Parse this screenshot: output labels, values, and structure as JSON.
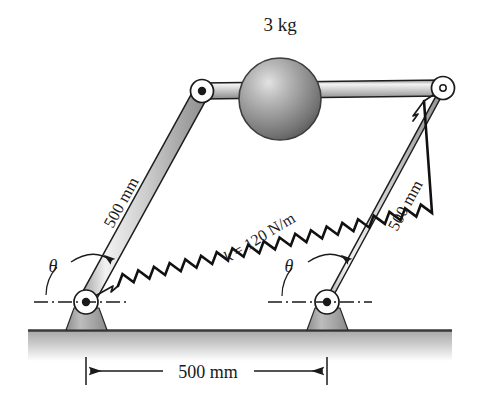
{
  "figure": {
    "type": "mechanism-diagram",
    "background_color": "#ffffff",
    "ink_color": "#1a1a1a"
  },
  "labels": {
    "mass": "3 kg",
    "spring_stiffness": "k = 120 N/m",
    "spring_stiffness_symbol": "k",
    "spring_stiffness_value": "= 120 N/m",
    "left_link_length": "500 mm",
    "right_link_length": "500 mm",
    "base_dimension": "500 mm",
    "angle_left": "θ",
    "angle_right": "θ"
  },
  "values": {
    "mass_kg": 3,
    "spring_constant_N_per_m": 120,
    "link_length_mm": 500,
    "base_span_mm": 500,
    "angle_symbol": "theta"
  },
  "colors": {
    "link_fill_light": "#f2f2f2",
    "link_fill_mid": "#c9c9c9",
    "link_fill_dark": "#9a9a9a",
    "sphere_light": "#d8d8d8",
    "sphere_mid": "#9d9d9d",
    "sphere_dark": "#6a6a6a",
    "support_fill": "#a9a9a9",
    "ground_line": "#4a4a4a",
    "ground_shade": "#b8b8b8",
    "outline": "#1a1a1a"
  },
  "geometry": {
    "pivot_top_left": {
      "x": 202,
      "y": 91
    },
    "pivot_top_right": {
      "x": 443,
      "y": 88
    },
    "pivot_bottom_left": {
      "x": 86,
      "y": 302
    },
    "pivot_bottom_right": {
      "x": 327,
      "y": 302
    },
    "sphere_center": {
      "x": 280,
      "y": 99
    },
    "sphere_radius": 41,
    "ground_y": 330,
    "dimension_line_y": 371,
    "dimension_left_x": 86,
    "dimension_right_x": 327,
    "spring_coils": 20
  }
}
